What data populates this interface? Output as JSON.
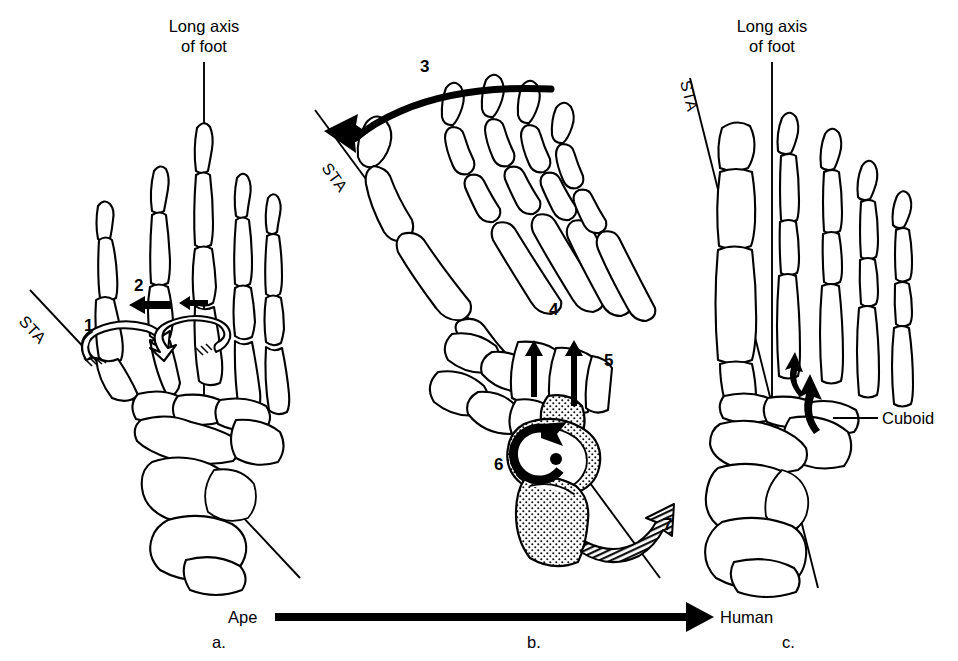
{
  "figure": {
    "title_left": "Long axis\nof foot",
    "axis_label_line1": "Long axis",
    "axis_label_line2": "of foot",
    "sta_label": "STA",
    "cuboid_label": "Cuboid",
    "sequence_start": "Ape",
    "sequence_end": "Human",
    "panel_labels": [
      "a.",
      "b.",
      "c."
    ],
    "numbers": [
      "1",
      "2",
      "3",
      "4",
      "5",
      "6",
      "7"
    ],
    "colors": {
      "background": "#ffffff",
      "ink": "#000000",
      "bone_fill": "#ffffff",
      "stipple_fill": "#000000"
    }
  },
  "panels": [
    {
      "id": "a",
      "label": "a.",
      "caption": "Ape",
      "axis_label_line1": "Long axis",
      "axis_label_line2": "of foot",
      "sta_label": "STA",
      "annotations": [
        {
          "number": "1",
          "kind": "hollow-rotation-arrow",
          "target": "hallux metatarsal"
        },
        {
          "number": "2",
          "kind": "solid-translation-arrow",
          "target": "second metatarsal"
        }
      ]
    },
    {
      "id": "b",
      "label": "b.",
      "caption": "",
      "sta_label": "STA",
      "annotations": [
        {
          "number": "3",
          "kind": "curved-solid-arrow",
          "target": "forefoot rotation"
        },
        {
          "number": "4",
          "kind": "solid-up-arrow",
          "target": "fourth metatarsal"
        },
        {
          "number": "5",
          "kind": "solid-up-arrow",
          "target": "fifth metatarsal"
        },
        {
          "number": "6",
          "kind": "circular-rotation-arrow",
          "target": "talus"
        },
        {
          "number": "7",
          "kind": "hatched-curved-arrow",
          "target": "calcaneus"
        }
      ]
    },
    {
      "id": "c",
      "label": "c.",
      "caption": "Human",
      "axis_label_line1": "Long axis",
      "axis_label_line2": "of foot",
      "sta_label": "STA",
      "annotations": [
        {
          "number": "",
          "kind": "leader-label",
          "target": "Cuboid"
        }
      ]
    }
  ],
  "legend": {
    "left_text": "Ape",
    "right_text": "Human",
    "arrow_direction": "right"
  }
}
